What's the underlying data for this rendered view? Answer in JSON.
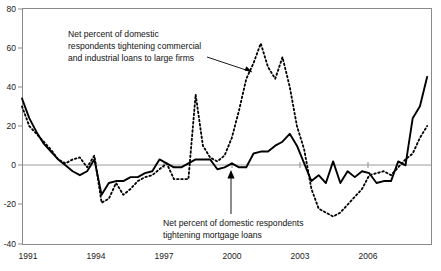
{
  "chart_data": {
    "type": "line",
    "title": "",
    "xlabel": "",
    "ylabel": "",
    "ylim": [
      -40,
      80
    ],
    "xlim": [
      1991.0,
      2008.0
    ],
    "grid": false,
    "legend_position": "annotations-inline",
    "yticks": [
      80,
      60,
      40,
      20,
      0,
      -20,
      -40
    ],
    "ytick_labels": [
      "80",
      "60",
      "40",
      "20",
      "0",
      "-20",
      "-40"
    ],
    "xticks": [
      1991,
      1994,
      1997,
      2000,
      2003,
      2006
    ],
    "xtick_labels": [
      "1991",
      "1994",
      "1997",
      "2000",
      "2003",
      "2006"
    ],
    "zero_reference_line": 0,
    "annotations": [
      {
        "name": "commercial-industrial-annotation",
        "lines": [
          "Net percent of domestic",
          "respondents tightening commercial",
          "and industrial loans to large firms"
        ],
        "points_to_series": "Net percent of domestic respondents tightening commercial and industrial loans to large firms"
      },
      {
        "name": "mortgage-annotation",
        "lines": [
          "Net percent of domestic respondents",
          "tightening mortgage loans"
        ],
        "points_to_series": "Net percent of domestic respondents tightening mortgage loans"
      }
    ],
    "series": [
      {
        "name": "Net percent of domestic respondents tightening mortgage loans",
        "style": "solid",
        "color": "#000000",
        "x": [
          1991.0,
          1991.3,
          1991.6,
          1991.9,
          1992.2,
          1992.5,
          1992.8,
          1993.1,
          1993.4,
          1993.7,
          1994.0,
          1994.3,
          1994.6,
          1994.9,
          1995.2,
          1995.5,
          1995.8,
          1996.1,
          1996.4,
          1996.7,
          1997.0,
          1997.3,
          1997.6,
          1997.9,
          1998.2,
          1998.5,
          1998.8,
          1999.1,
          1999.4,
          1999.7,
          2000.0,
          2000.3,
          2000.6,
          2000.9,
          2001.2,
          2001.5,
          2001.8,
          2002.1,
          2002.4,
          2002.7,
          2003.0,
          2003.3,
          2003.6,
          2003.9,
          2004.2,
          2004.5,
          2004.8,
          2005.1,
          2005.4,
          2005.7,
          2006.0,
          2006.3,
          2006.6,
          2006.9,
          2007.2,
          2007.5,
          2007.8
        ],
        "y": [
          34,
          24,
          17,
          11,
          7,
          3,
          0,
          -3,
          -5,
          -3,
          3,
          -15,
          -9,
          -8,
          -8,
          -6,
          -6,
          -4,
          -3,
          3,
          1,
          -1,
          -1,
          1,
          3,
          3,
          3,
          -2,
          -1,
          1,
          -1,
          -1,
          6,
          7,
          7,
          10,
          12,
          16,
          10,
          1,
          -8,
          -5,
          -9,
          2,
          -9,
          -3,
          -6,
          -3,
          -4,
          -9,
          -8,
          -8,
          2,
          0,
          24,
          30,
          45
        ]
      },
      {
        "name": "Net percent of domestic respondents tightening commercial and industrial loans to large firms",
        "style": "dashed",
        "color": "#000000",
        "x": [
          1991.0,
          1991.3,
          1991.6,
          1991.9,
          1992.2,
          1992.5,
          1992.8,
          1993.1,
          1993.4,
          1993.7,
          1994.0,
          1994.3,
          1994.6,
          1994.9,
          1995.2,
          1995.5,
          1995.8,
          1996.1,
          1996.4,
          1996.7,
          1997.0,
          1997.3,
          1997.6,
          1997.9,
          1998.2,
          1998.5,
          1998.8,
          1999.1,
          1999.4,
          1999.7,
          2000.0,
          2000.3,
          2000.6,
          2000.9,
          2001.2,
          2001.5,
          2001.8,
          2002.1,
          2002.4,
          2002.7,
          2003.0,
          2003.3,
          2003.6,
          2003.9,
          2004.2,
          2004.5,
          2004.8,
          2005.1,
          2005.4,
          2005.7,
          2006.0,
          2006.3,
          2006.6,
          2006.9,
          2007.2,
          2007.5,
          2007.8
        ],
        "y": [
          30,
          20,
          16,
          12,
          8,
          3,
          1,
          3,
          4,
          -1,
          5,
          -19,
          -17,
          -9,
          -15,
          -12,
          -8,
          -6,
          -5,
          -2,
          1,
          -7,
          -7,
          -7,
          36,
          10,
          4,
          2,
          5,
          14,
          28,
          44,
          52,
          62,
          50,
          44,
          55,
          40,
          20,
          8,
          -12,
          -22,
          -24,
          -26,
          -24,
          -20,
          -16,
          -12,
          -5,
          -4,
          -3,
          -5,
          -1,
          3,
          6,
          14,
          20
        ]
      }
    ]
  },
  "frame": {
    "left_px": 22,
    "top_px": 8,
    "right_px": 432,
    "bottom_px": 244
  }
}
